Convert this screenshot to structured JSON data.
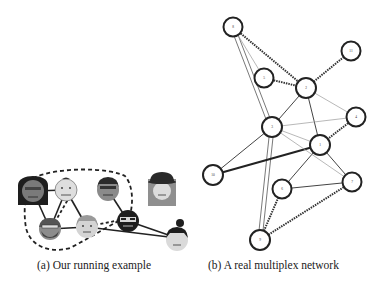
{
  "figure": {
    "panel_a": {
      "caption": "(a) Our running example",
      "people": [
        {
          "id": "p1",
          "desc": "dark-haired woman with glasses",
          "x": 33,
          "y": 191
        },
        {
          "id": "p2",
          "desc": "light-skinned person",
          "x": 66,
          "y": 190
        },
        {
          "id": "p3",
          "desc": "man with glasses and dark hair",
          "x": 108,
          "y": 190
        },
        {
          "id": "p4",
          "desc": "woman with hat (isolated)",
          "x": 162,
          "y": 189
        },
        {
          "id": "p5",
          "desc": "bearded man with glasses",
          "x": 50,
          "y": 229
        },
        {
          "id": "p6",
          "desc": "person with reddish hair",
          "x": 87,
          "y": 227
        },
        {
          "id": "p7",
          "desc": "bearded man with sunglasses",
          "x": 128,
          "y": 221
        },
        {
          "id": "p8",
          "desc": "person with dark bun hair",
          "x": 177,
          "y": 238
        }
      ],
      "solid_edges": [
        [
          "p1",
          "p2"
        ],
        [
          "p1",
          "p5"
        ],
        [
          "p2",
          "p5"
        ],
        [
          "p2",
          "p6"
        ],
        [
          "p5",
          "p6"
        ],
        [
          "p3",
          "p7"
        ],
        [
          "p7",
          "p8"
        ],
        [
          "p6",
          "p8"
        ]
      ],
      "dashed_edges": [
        [
          "p1",
          "p3"
        ],
        [
          "p2",
          "p5"
        ],
        [
          "p6",
          "p7"
        ]
      ],
      "dashed_loop": "encloses p1, p2, p5, p6, p3 group"
    },
    "panel_b": {
      "caption": "(b) A real multiplex network",
      "nodes": [
        {
          "label": "8",
          "x": 233,
          "y": 27
        },
        {
          "label": "5",
          "x": 264,
          "y": 78
        },
        {
          "label": "2",
          "x": 306,
          "y": 88
        },
        {
          "label": "11",
          "x": 351,
          "y": 51
        },
        {
          "label": "4",
          "x": 356,
          "y": 117
        },
        {
          "label": "3",
          "x": 272,
          "y": 127
        },
        {
          "label": "1",
          "x": 320,
          "y": 145
        },
        {
          "label": "10",
          "x": 213,
          "y": 175
        },
        {
          "label": "6",
          "x": 282,
          "y": 189
        },
        {
          "label": "7",
          "x": 352,
          "y": 182
        },
        {
          "label": "9",
          "x": 260,
          "y": 240
        }
      ],
      "edges": [
        {
          "from": "8",
          "to": "2",
          "style": "heavy-dashed"
        },
        {
          "from": "8",
          "to": "3",
          "style": "double"
        },
        {
          "from": "8",
          "to": "5",
          "style": "thin"
        },
        {
          "from": "5",
          "to": "2",
          "style": "heavy-dashed"
        },
        {
          "from": "2",
          "to": "11",
          "style": "heavy-dashed"
        },
        {
          "from": "2",
          "to": "3",
          "style": "thin"
        },
        {
          "from": "2",
          "to": "1",
          "style": "medium"
        },
        {
          "from": "2",
          "to": "4",
          "style": "light"
        },
        {
          "from": "3",
          "to": "4",
          "style": "light"
        },
        {
          "from": "3",
          "to": "1",
          "style": "light"
        },
        {
          "from": "4",
          "to": "1",
          "style": "heavy-dashed"
        },
        {
          "from": "10",
          "to": "3",
          "style": "medium"
        },
        {
          "from": "10",
          "to": "1",
          "style": "heavy"
        },
        {
          "from": "6",
          "to": "1",
          "style": "medium"
        },
        {
          "from": "6",
          "to": "7",
          "style": "medium"
        },
        {
          "from": "7",
          "to": "1",
          "style": "medium"
        },
        {
          "from": "3",
          "to": "7",
          "style": "light"
        },
        {
          "from": "9",
          "to": "3",
          "style": "double"
        },
        {
          "from": "9",
          "to": "6",
          "style": "heavy-dashed"
        },
        {
          "from": "9",
          "to": "7",
          "style": "heavy-dashed"
        }
      ]
    }
  },
  "colors": {
    "background": "#ffffff",
    "stroke": "#222222",
    "light_edge": "#9a9a9a",
    "face_light": "#d9d9d9",
    "face_mid": "#8c8c8c",
    "hair_dark": "#1e1e1e"
  }
}
